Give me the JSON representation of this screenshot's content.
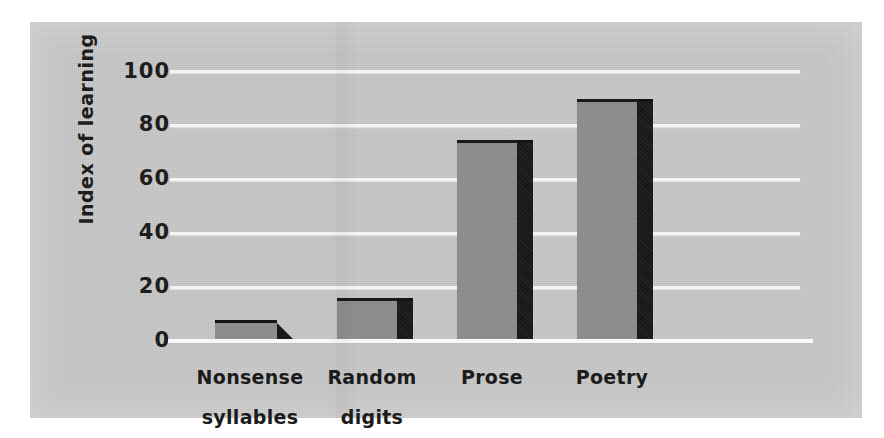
{
  "chart_data": {
    "type": "bar",
    "title": "",
    "xlabel": "",
    "ylabel": "Index of learning",
    "categories": [
      "Nonsense syllables",
      "Random digits",
      "Prose",
      "Poetry"
    ],
    "category_lines": [
      [
        "Nonsense",
        "syllables"
      ],
      [
        "Random",
        "digits"
      ],
      [
        "Prose"
      ],
      [
        "Poetry"
      ]
    ],
    "values": [
      6,
      14,
      73,
      88
    ],
    "ylim": [
      0,
      100
    ],
    "yticks": [
      0,
      20,
      40,
      60,
      80,
      100
    ],
    "ytick_labels": [
      "0",
      "20",
      "40",
      "60",
      "80",
      "100"
    ],
    "grid": true,
    "legend": "none",
    "style": "3d-bar",
    "colors": {
      "panel_background": "#c9c9c9",
      "bar_front": "#8d8d8d",
      "bar_side": "#191919",
      "gridline": "#f4f4f4",
      "text": "#1d1d1d",
      "page_background": "#ffffff"
    }
  }
}
